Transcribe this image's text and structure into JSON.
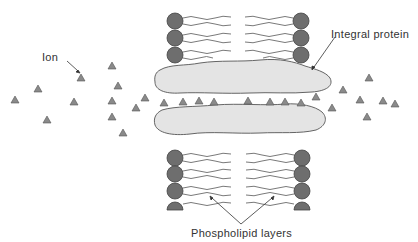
{
  "diagram": {
    "type": "cell-membrane-ion-channel",
    "labels": {
      "ion": "Ion",
      "integral_protein": "Integral protein",
      "phospholipid_layers": "Phospholipid layers"
    },
    "colors": {
      "background": "#ffffff",
      "phospholipid_head": "#6e6e6e",
      "phospholipid_head_stroke": "#444444",
      "tail": "#666666",
      "protein_fill": "#e4e4e4",
      "protein_stroke": "#555555",
      "ion_fill": "#8a8a8a",
      "ion_stroke": "#555555",
      "text": "#333333",
      "arrow": "#333333"
    },
    "phospholipid_heads": {
      "top_left": [
        [
          175,
          21
        ],
        [
          175,
          38
        ],
        [
          175,
          55
        ]
      ],
      "top_right": [
        [
          301,
          21
        ],
        [
          301,
          38
        ],
        [
          301,
          55
        ]
      ],
      "bottom_left": [
        [
          175,
          158
        ],
        [
          175,
          174
        ],
        [
          175,
          191
        ],
        [
          175,
          207
        ]
      ],
      "bottom_right": [
        [
          302,
          158
        ],
        [
          302,
          174
        ],
        [
          302,
          191
        ],
        [
          302,
          207
        ]
      ],
      "radius": 8
    },
    "ions": [
      [
        15,
        99
      ],
      [
        38,
        88
      ],
      [
        47,
        119
      ],
      [
        74,
        101
      ],
      [
        81,
        77
      ],
      [
        112,
        65
      ],
      [
        118,
        85
      ],
      [
        112,
        100
      ],
      [
        112,
        116
      ],
      [
        123,
        132
      ],
      [
        136,
        107
      ],
      [
        145,
        97
      ],
      [
        164,
        103
      ],
      [
        183,
        102
      ],
      [
        199,
        101
      ],
      [
        214,
        102
      ],
      [
        248,
        101
      ],
      [
        270,
        102
      ],
      [
        285,
        102
      ],
      [
        301,
        103
      ],
      [
        316,
        97
      ],
      [
        332,
        108
      ],
      [
        343,
        90
      ],
      [
        369,
        78
      ],
      [
        360,
        100
      ],
      [
        383,
        101
      ],
      [
        367,
        117
      ],
      [
        395,
        104
      ]
    ]
  }
}
